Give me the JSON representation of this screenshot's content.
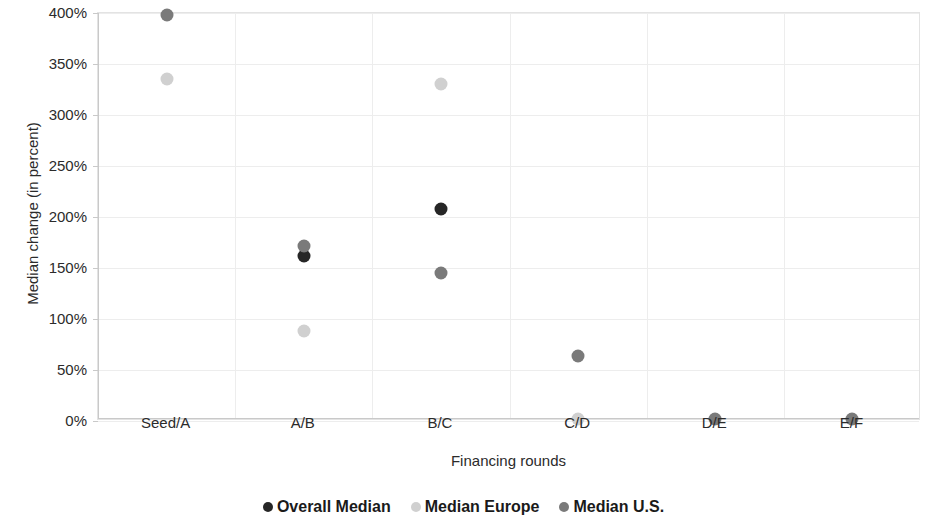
{
  "chart_data": {
    "type": "scatter",
    "title": "",
    "xlabel": "Financing rounds",
    "ylabel": "Median change (in percent)",
    "categories": [
      "Seed/A",
      "A/B",
      "B/C",
      "C/D",
      "D/E",
      "E/F"
    ],
    "ylim": [
      0,
      400
    ],
    "ytick_labels": [
      "0%",
      "50%",
      "100%",
      "150%",
      "200%",
      "250%",
      "300%",
      "350%",
      "400%"
    ],
    "ytick_values": [
      0,
      50,
      100,
      150,
      200,
      250,
      300,
      350,
      400
    ],
    "grid": true,
    "legend_position": "bottom",
    "series": [
      {
        "name": "Overall Median",
        "color": "#262626",
        "values": [
          null,
          162,
          208,
          null,
          null,
          null
        ]
      },
      {
        "name": "Median Europe",
        "color": "#d0d0d0",
        "values": [
          335,
          88,
          330,
          2,
          null,
          null
        ]
      },
      {
        "name": "Median U.S.",
        "color": "#7a7a7a",
        "values": [
          398,
          172,
          145,
          64,
          2,
          2
        ]
      }
    ]
  },
  "axes": {
    "y_title": "Median change (in percent)",
    "x_title": "Financing rounds"
  },
  "legend": {
    "entries": [
      {
        "label": "Overall Median",
        "color": "#262626",
        "swatch": "dot-icon"
      },
      {
        "label": "Median Europe",
        "color": "#d0d0d0",
        "swatch": "dot-icon"
      },
      {
        "label": "Median U.S.",
        "color": "#7a7a7a",
        "swatch": "dot-icon"
      }
    ]
  }
}
